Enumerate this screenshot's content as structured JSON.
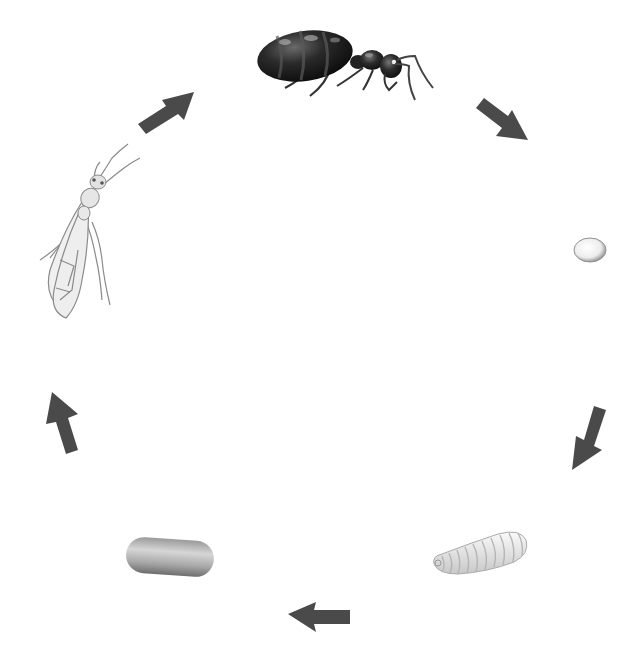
{
  "diagram": {
    "type": "cycle",
    "title": "",
    "direction": "clockwise",
    "background": "#ffffff",
    "arrow_color": "#4a4a4a",
    "stages": [
      {
        "id": "queen",
        "label": "Queen ant",
        "icon": "queen-ant-icon",
        "position": "top-center"
      },
      {
        "id": "egg",
        "label": "Egg",
        "icon": "egg-icon",
        "position": "right"
      },
      {
        "id": "larva",
        "label": "Larva",
        "icon": "larva-icon",
        "position": "bottom-right"
      },
      {
        "id": "pupa",
        "label": "Pupa",
        "icon": "pupa-icon",
        "position": "bottom-left"
      },
      {
        "id": "winged-adult",
        "label": "Winged adult",
        "icon": "winged-ant-icon",
        "position": "left"
      }
    ],
    "arrows": [
      {
        "from": "queen",
        "to": "egg",
        "direction": "down-right"
      },
      {
        "from": "egg",
        "to": "larva",
        "direction": "down-left"
      },
      {
        "from": "larva",
        "to": "pupa",
        "direction": "left"
      },
      {
        "from": "pupa",
        "to": "winged-adult",
        "direction": "up"
      },
      {
        "from": "winged-adult",
        "to": "queen",
        "direction": "up-right"
      }
    ]
  }
}
